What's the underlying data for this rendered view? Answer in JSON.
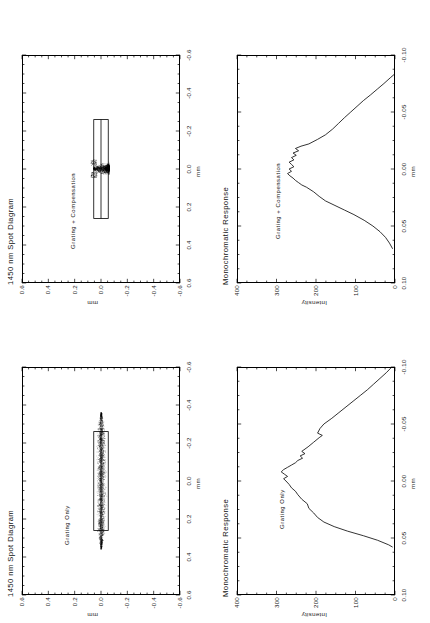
{
  "figure": {
    "orientation": "landscape-rotated-90ccw",
    "background": "#ffffff",
    "ink": "#000000"
  },
  "panels": [
    {
      "id": "spot-grating-compensation",
      "title": "1450 nm Spot Diagram",
      "subtitle": "Grating + Compensation",
      "xlabel": "mm",
      "ylabel": "mm",
      "xticks": [
        "0.6",
        "0.4",
        "0.2",
        "0.0",
        "-0.2",
        "-0.4",
        "-0.6"
      ],
      "yticks": [
        "0.6",
        "0.4",
        "0.2",
        "0.0",
        "-0.2",
        "-0.4",
        "-0.6"
      ],
      "xlim": [
        -0.6,
        0.6
      ],
      "ylim": [
        -0.6,
        0.6
      ],
      "minor_per_major": 4,
      "detector_box": {
        "x0": -0.26,
        "x1": 0.26,
        "y0": -0.055,
        "y1": 0.055,
        "midline_y": 0.0
      }
    },
    {
      "id": "response-grating-compensation",
      "title": "Monochromatic Response",
      "subtitle": "Grating + Compensation",
      "xlabel": "mm",
      "ylabel": "Intensity",
      "xticks": [
        "0.10",
        "0.05",
        "0.00",
        "-0.05",
        "-0.10"
      ],
      "yticks": [
        "400",
        "300",
        "200",
        "100",
        "0"
      ],
      "xlim": [
        -0.1,
        0.1
      ],
      "ylim": [
        0,
        400
      ],
      "minor_per_major": 4
    },
    {
      "id": "spot-grating-only",
      "title": "1450 nm Spot Diagram",
      "subtitle": "Grating Only",
      "xlabel": "mm",
      "ylabel": "mm",
      "xticks": [
        "0.6",
        "0.4",
        "0.2",
        "0.0",
        "-0.2",
        "-0.4",
        "-0.6"
      ],
      "yticks": [
        "0.6",
        "0.4",
        "0.2",
        "0.0",
        "-0.2",
        "-0.4",
        "-0.6"
      ],
      "xlim": [
        -0.6,
        0.6
      ],
      "ylim": [
        -0.6,
        0.6
      ],
      "minor_per_major": 4,
      "detector_box": {
        "x0": -0.26,
        "x1": 0.26,
        "y0": -0.055,
        "y1": 0.055,
        "midline_y": 0.0
      }
    },
    {
      "id": "response-grating-only",
      "title": "Monochromatic Response",
      "subtitle": "Grating Only",
      "xlabel": "mm",
      "ylabel": "Intensity",
      "xticks": [
        "0.10",
        "0.05",
        "0.00",
        "-0.05",
        "-0.10"
      ],
      "yticks": [
        "400",
        "300",
        "200",
        "100",
        "0"
      ],
      "xlim": [
        -0.1,
        0.1
      ],
      "ylim": [
        0,
        400
      ],
      "minor_per_major": 4
    }
  ],
  "chart_data": [
    {
      "id": "spot-grating-compensation",
      "type": "scatter",
      "title": "1450 nm Spot Diagram",
      "annotation": "Grating + Compensation",
      "xlabel": "mm",
      "ylabel": "mm",
      "xlim": [
        -0.6,
        0.6
      ],
      "ylim": [
        -0.6,
        0.6
      ],
      "grid": false,
      "legend": "none",
      "description": "Dense teardrop / heart shaped ray-intersection cloud centred at (0,0), roughly 0.07 mm wide and 0.12 mm tall, with two faint upward wing lobes. A rectangular detector aperture outline spans x -0.26..0.26 and y -0.055..0.055 with a horizontal mid-line at y = 0.",
      "cloud": {
        "cx": 0.0,
        "cy": 0.0,
        "half_width": 0.035,
        "half_height": 0.06,
        "n_points": 1800,
        "shape": "teardrop"
      },
      "overlay_box": {
        "x0": -0.26,
        "x1": 0.26,
        "y0": -0.055,
        "y1": 0.055
      }
    },
    {
      "id": "response-grating-compensation",
      "type": "line",
      "title": "Monochromatic Response",
      "annotation": "Grating + Compensation",
      "xlabel": "mm",
      "ylabel": "Intensity",
      "xlim": [
        -0.1,
        0.1
      ],
      "ylim": [
        0,
        400
      ],
      "grid": false,
      "legend": "none",
      "x": [
        -0.083,
        -0.08,
        -0.075,
        -0.07,
        -0.065,
        -0.06,
        -0.055,
        -0.05,
        -0.045,
        -0.04,
        -0.035,
        -0.03,
        -0.026,
        -0.022,
        -0.02,
        -0.018,
        -0.016,
        -0.014,
        -0.012,
        -0.01,
        -0.008,
        -0.006,
        -0.004,
        -0.002,
        0.0,
        0.002,
        0.004,
        0.006,
        0.008,
        0.01,
        0.012,
        0.014,
        0.016,
        0.02,
        0.024,
        0.028,
        0.032,
        0.036,
        0.04,
        0.045,
        0.05,
        0.055,
        0.06,
        0.065,
        0.07
      ],
      "y": [
        2,
        12,
        28,
        45,
        62,
        80,
        96,
        112,
        128,
        143,
        158,
        176,
        196,
        218,
        238,
        252,
        244,
        258,
        250,
        262,
        256,
        268,
        262,
        256,
        268,
        262,
        272,
        266,
        258,
        252,
        244,
        236,
        224,
        206,
        192,
        176,
        152,
        128,
        104,
        78,
        56,
        38,
        24,
        14,
        6
      ]
    },
    {
      "id": "spot-grating-only",
      "type": "scatter",
      "title": "1450 nm Spot Diagram",
      "annotation": "Grating Only",
      "xlabel": "mm",
      "ylabel": "mm",
      "xlim": [
        -0.6,
        0.6
      ],
      "ylim": [
        -0.6,
        0.6
      ],
      "grid": false,
      "legend": "none",
      "description": "Broad horizontal smear of ray intersections extending roughly x -0.36..0.36, y -0.045..0.045, denser along the centre line. A rectangular detector aperture outline spans x -0.26..0.26 and y -0.055..0.055 with a horizontal mid-line at y = 0.",
      "cloud": {
        "cx": 0.0,
        "cy": 0.0,
        "half_width": 0.36,
        "half_height": 0.045,
        "n_points": 3200,
        "shape": "smear"
      },
      "overlay_box": {
        "x0": -0.26,
        "x1": 0.26,
        "y0": -0.055,
        "y1": 0.055
      }
    },
    {
      "id": "response-grating-only",
      "type": "line",
      "title": "Monochromatic Response",
      "annotation": "Grating Only",
      "xlabel": "mm",
      "ylabel": "Intensity",
      "xlim": [
        -0.1,
        0.1
      ],
      "ylim": [
        0,
        400
      ],
      "grid": false,
      "legend": "none",
      "x": [
        -0.1,
        -0.095,
        -0.09,
        -0.085,
        -0.08,
        -0.075,
        -0.07,
        -0.065,
        -0.06,
        -0.055,
        -0.05,
        -0.046,
        -0.042,
        -0.04,
        -0.038,
        -0.034,
        -0.03,
        -0.026,
        -0.024,
        -0.022,
        -0.02,
        -0.018,
        -0.016,
        -0.014,
        -0.012,
        -0.01,
        -0.008,
        -0.006,
        -0.004,
        -0.002,
        0.0,
        0.003,
        0.006,
        0.009,
        0.012,
        0.016,
        0.02,
        0.024,
        0.028,
        0.032,
        0.036,
        0.04,
        0.044,
        0.048,
        0.052,
        0.056,
        0.058
      ],
      "y": [
        8,
        22,
        38,
        54,
        70,
        88,
        106,
        124,
        142,
        160,
        180,
        190,
        196,
        184,
        192,
        206,
        220,
        236,
        228,
        240,
        234,
        246,
        252,
        262,
        272,
        282,
        288,
        280,
        272,
        282,
        276,
        268,
        262,
        252,
        246,
        236,
        222,
        218,
        206,
        196,
        180,
        154,
        120,
        80,
        44,
        16,
        6
      ]
    }
  ]
}
